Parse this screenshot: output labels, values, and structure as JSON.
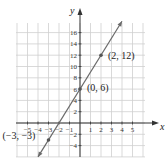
{
  "chart_data": {
    "type": "line",
    "title": "",
    "xlabel": "x",
    "ylabel": "y",
    "xlim": [
      -6,
      6
    ],
    "ylim": [
      -6,
      18
    ],
    "grid": true,
    "x_tick_labels": [
      "-5",
      "-4",
      "-3",
      "-2",
      "-1",
      "1",
      "2",
      "3",
      "4",
      "5"
    ],
    "y_tick_labels": [
      "-4",
      "-2",
      "2",
      "4",
      "6",
      "8",
      "10",
      "12",
      "14",
      "16"
    ],
    "series": [
      {
        "name": "y = 3x + 6",
        "x": [
          -4,
          4
        ],
        "y": [
          -6,
          18
        ]
      }
    ],
    "points": [
      {
        "x": -3,
        "y": -3,
        "label": "(−3, −3)"
      },
      {
        "x": 0,
        "y": 6,
        "label": "(0, 6)"
      },
      {
        "x": 2,
        "y": 12,
        "label": "(2, 12)"
      }
    ],
    "colors": {
      "line": "#6a6a6a",
      "grid": "#cfcfcf",
      "axis": "#333333"
    }
  }
}
